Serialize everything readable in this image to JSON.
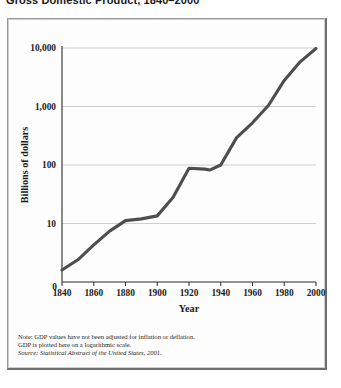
{
  "title": "Gross Domestic Product, 1840–2000",
  "frame": {
    "background_color": "#fdfdfd",
    "border_color": "#6f6f6f"
  },
  "notes": {
    "line1": "Note: GDP values have not been adjusted for inflation or deflation.",
    "line2": "GDP is plotted here on a logarithmic scale.",
    "source": "Source: Statistical Abstract of the United States, 2001."
  },
  "colors": {
    "line": "#4e4e4e",
    "grid": "#c9c9c9",
    "axis": "#2b2b2b",
    "text": "#1c1c1c"
  },
  "chart_data": {
    "type": "line",
    "title": "Gross Domestic Product, 1840–2000",
    "xlabel": "Year",
    "ylabel": "Billions of dollars",
    "yscale": "log",
    "ylim": [
      1,
      10000
    ],
    "xlim": [
      1840,
      2000
    ],
    "grid": true,
    "legend": false,
    "origin_label": "0",
    "ytick_labels": [
      "10,000",
      "1,000",
      "100",
      "10"
    ],
    "ytick_values": [
      10000,
      1000,
      100,
      10
    ],
    "xtick_labels": [
      "1840",
      "1860",
      "1880",
      "1900",
      "1920",
      "1940",
      "1960",
      "1980",
      "2000"
    ],
    "xtick_values": [
      1840,
      1860,
      1880,
      1900,
      1920,
      1940,
      1960,
      1980,
      2000
    ],
    "series": [
      {
        "name": "Gross Domestic Product",
        "x": [
          1840,
          1850,
          1860,
          1870,
          1880,
          1890,
          1900,
          1910,
          1920,
          1930,
          1933,
          1940,
          1950,
          1960,
          1970,
          1980,
          1990,
          2000
        ],
        "values": [
          1.6,
          2.4,
          4.3,
          7.4,
          11.2,
          12.0,
          13.5,
          28.0,
          88.0,
          85.0,
          82.0,
          100.0,
          294.0,
          527.0,
          1040.0,
          2790.0,
          5800.0,
          9800.0
        ]
      }
    ],
    "annotations": [
      "Plateau near 11–13 billion dollars between 1880 and 1900",
      "Plateau near 82–88 billion dollars between 1920 and 1933",
      "Steep sustained rise from 1940 to 2000"
    ]
  }
}
